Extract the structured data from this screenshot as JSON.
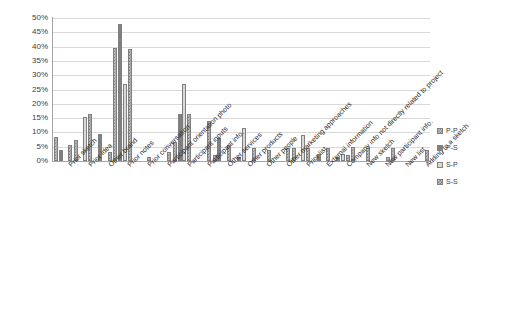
{
  "chart_data": {
    "type": "bar",
    "title": "",
    "xlabel": "",
    "ylabel": "",
    "ylim": [
      0,
      50
    ],
    "ytick_labels": [
      "50%",
      "45%",
      "40%",
      "35%",
      "30%",
      "25%",
      "20%",
      "15%",
      "10%",
      "5%",
      "0%"
    ],
    "ytick_values": [
      50,
      45,
      40,
      35,
      30,
      25,
      20,
      15,
      10,
      5,
      0
    ],
    "grid": true,
    "legend_position": "right",
    "categories": [
      "Prior sketch",
      "Prior idea",
      "Other brand",
      "Prior notes",
      "Prior conversation",
      "Participant orientation photo",
      "Participant inputs",
      "Participant info.",
      "Other services",
      "Other products",
      "Other people",
      "Other marketing approaches",
      "Prior list",
      "External information",
      "Company info not directly related to project",
      "New sketch",
      "New participant info.",
      "New list",
      "Adding to a sketch"
    ],
    "series": [
      {
        "name": "P-P",
        "color": "#bfbfbf",
        "pattern": "checker",
        "values": [
          8.5,
          7.5,
          0,
          39.5,
          0,
          0,
          6.5,
          0,
          2,
          0,
          4.5,
          0,
          4.5,
          0,
          0,
          5,
          0,
          4.5,
          0
        ]
      },
      {
        "name": "P-S",
        "color": "#808080",
        "pattern": "solid",
        "values": [
          4,
          0,
          9.5,
          48,
          0,
          0,
          16.5,
          0,
          8,
          1.5,
          0,
          0,
          0,
          2.5,
          1.5,
          0,
          0,
          0,
          0
        ]
      },
      {
        "name": "S-P",
        "color": "#d9d9d9",
        "pattern": "light",
        "values": [
          0,
          15.5,
          0,
          27,
          0,
          0,
          27,
          0,
          0,
          11.5,
          0,
          0,
          9,
          0,
          2.5,
          0,
          0,
          0,
          0
        ]
      },
      {
        "name": "S-S",
        "color": "#c0c0c0",
        "pattern": "checker",
        "values": [
          5.5,
          16.5,
          3,
          39,
          1.5,
          3,
          16.5,
          14,
          5.5,
          0,
          4,
          4.5,
          4.5,
          4.5,
          2,
          4.5,
          1.5,
          0,
          4
        ]
      }
    ]
  },
  "legend": {
    "items": [
      {
        "label": "P-P"
      },
      {
        "label": "P-S"
      },
      {
        "label": "S-P"
      },
      {
        "label": "S-S"
      }
    ]
  }
}
